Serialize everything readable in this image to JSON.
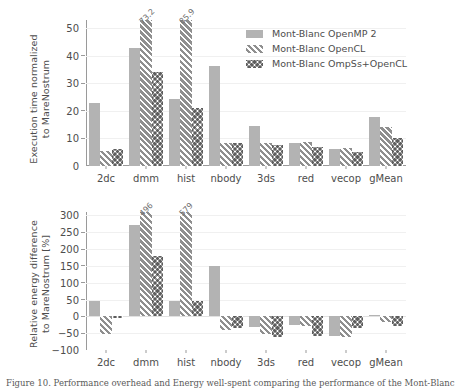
{
  "figure": {
    "caption": "Figure 10. Performance overhead and Energy well-spent comparing the performance of the Mont-Blanc"
  },
  "legend": {
    "position": "upper-right",
    "entries": [
      {
        "label": "Mont-Blanc OpenMP 2",
        "series": "s0"
      },
      {
        "label": "Mont-Blanc OpenCL",
        "series": "s1"
      },
      {
        "label": "Mont-Blanc OmpSs+OpenCL",
        "series": "s2"
      }
    ]
  },
  "chart_data": [
    {
      "type": "bar",
      "id": "execution-time",
      "title": "",
      "xlabel": "",
      "ylabel": "Execution time normalized\nto MareNostrum",
      "ylim": [
        0,
        53
      ],
      "yticks": [
        0,
        10,
        20,
        30,
        40,
        50
      ],
      "ytick_labels": [
        "0",
        "10",
        "20",
        "30",
        "40",
        "50"
      ],
      "grid": true,
      "categories": [
        "2dc",
        "dmm",
        "hist",
        "nbody",
        "3ds",
        "red",
        "vecop",
        "gMean"
      ],
      "series": [
        {
          "name": "Mont-Blanc OpenMP 2",
          "values": [
            23.0,
            42.8,
            24.3,
            36.2,
            14.7,
            8.3,
            6.2,
            17.9
          ]
        },
        {
          "name": "Mont-Blanc OpenCL",
          "values": [
            5.4,
            73.2,
            85.9,
            8.2,
            8.5,
            8.8,
            6.4,
            14.3
          ]
        },
        {
          "name": "Mont-Blanc OmpSs+OpenCL",
          "values": [
            6.0,
            34.2,
            21.0,
            8.2,
            7.6,
            7.0,
            5.1,
            10.3
          ]
        }
      ],
      "annotations": [
        {
          "category": "dmm",
          "series": 1,
          "text": "73.2"
        },
        {
          "category": "hist",
          "series": 1,
          "text": "85.9"
        }
      ]
    },
    {
      "type": "bar",
      "id": "relative-energy-difference",
      "title": "",
      "xlabel": "",
      "ylabel": "Relative energy difference\nto MareNostrum [%]",
      "ylim": [
        -100,
        310
      ],
      "yticks": [
        -100,
        -50,
        0,
        50,
        100,
        150,
        200,
        250,
        300
      ],
      "ytick_labels": [
        "−100",
        "−50",
        "0",
        "50",
        "100",
        "150",
        "200",
        "250",
        "300"
      ],
      "grid": true,
      "categories": [
        "2dc",
        "dmm",
        "hist",
        "nbody",
        "3ds",
        "red",
        "vecop",
        "gMean"
      ],
      "series": [
        {
          "name": "Mont-Blanc OpenMP 2",
          "values": [
            46,
            271,
            47,
            151,
            -32,
            -27,
            -58,
            4
          ]
        },
        {
          "name": "Mont-Blanc OpenCL",
          "values": [
            -52,
            496,
            579,
            -40,
            -52,
            -28,
            -60,
            -18
          ]
        },
        {
          "name": "Mont-Blanc OmpSs+OpenCL",
          "values": [
            -3,
            180,
            45,
            -34,
            -60,
            -59,
            -35,
            -29
          ]
        }
      ],
      "annotations": [
        {
          "category": "dmm",
          "series": 1,
          "text": "496"
        },
        {
          "category": "hist",
          "series": 1,
          "text": "579"
        }
      ]
    }
  ]
}
